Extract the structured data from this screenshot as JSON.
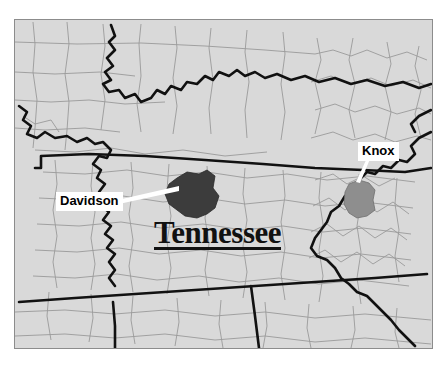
{
  "map": {
    "title": "Tennessee",
    "title_underlined": true,
    "background_color": "#ffffff",
    "land_color": "#d9d9d9",
    "county_line_color": "#9a9a9a",
    "state_line_color": "#111111",
    "frame_color": "#8c8c8c",
    "highlighted_counties": [
      {
        "name": "Davidson",
        "fill_color": "#3c3c3c",
        "label_background": "#ffffff",
        "label_text_color": "#000000",
        "leader_line_color": "#ffffff"
      },
      {
        "name": "Knox",
        "fill_color": "#8e8e8e",
        "label_background": "#ffffff",
        "label_text_color": "#000000",
        "leader_line_color": "#ffffff"
      }
    ],
    "labels": {
      "davidson": "Davidson",
      "knox": "Knox"
    }
  }
}
